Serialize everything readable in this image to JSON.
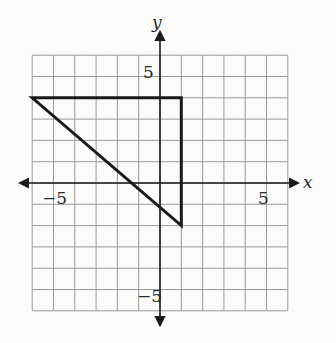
{
  "diagram": {
    "type": "coordinate-grid",
    "x_range": [
      -6,
      6
    ],
    "y_range": [
      -6,
      6
    ],
    "grid_step": 1,
    "axis_labels": {
      "x": "x",
      "y": "y"
    },
    "tick_labels": {
      "x_neg": "−5",
      "x_pos": "5",
      "y_pos": "5",
      "y_neg": "−5"
    },
    "shape": {
      "type": "triangle",
      "vertices": [
        [
          -6,
          4
        ],
        [
          1,
          4
        ],
        [
          1,
          -2
        ]
      ]
    },
    "colors": {
      "grid": "#9a9a9a",
      "axis": "#1a1a1a",
      "shape": "#1a1a1a",
      "background": "#fbfbfa"
    }
  }
}
